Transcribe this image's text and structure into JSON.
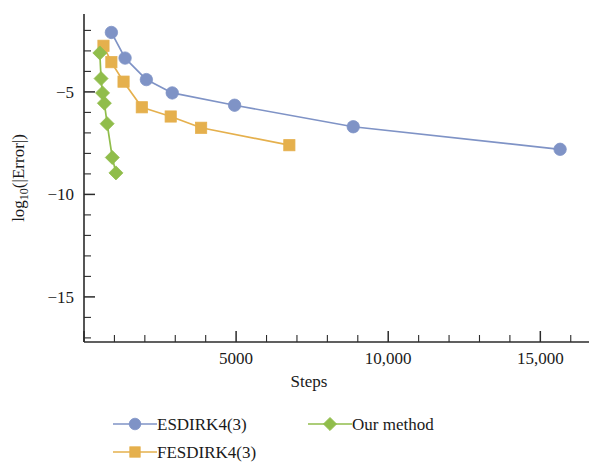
{
  "chart_data": {
    "type": "line",
    "title": "",
    "xlabel": "Steps",
    "ylabel": "log10(|Error|)",
    "ylabel_display": "log₁₀(|Error|)",
    "xlim": [
      0,
      16600
    ],
    "ylim": [
      -17.2,
      -1.2
    ],
    "grid": false,
    "legend_position": "bottom",
    "x_ticks_major": [
      5000,
      10000,
      15000
    ],
    "x_tick_labels": [
      "5000",
      "10,000",
      "15,000"
    ],
    "x_ticks_minor": [
      1000,
      2000,
      3000,
      4000,
      6000,
      7000,
      8000,
      9000,
      11000,
      12000,
      13000,
      14000,
      16000
    ],
    "y_ticks_major": [
      -5,
      -10,
      -15
    ],
    "y_tick_labels": [
      "−5",
      "−10",
      "−15"
    ],
    "y_ticks_minor": [
      -2,
      -3,
      -4,
      -6,
      -7,
      -8,
      -9,
      -11,
      -12,
      -13,
      -14,
      -16,
      -17
    ],
    "series": [
      {
        "name": "ESDIRK4(3)",
        "color": "#7f93c6",
        "marker": "circle",
        "x": [
          900,
          1350,
          2050,
          2900,
          4950,
          8850,
          15650
        ],
        "y": [
          -2.1,
          -3.35,
          -4.4,
          -5.05,
          -5.65,
          -6.7,
          -7.8
        ]
      },
      {
        "name": "FESDIRK4(3)",
        "color": "#e5b04d",
        "marker": "square",
        "x": [
          640,
          900,
          1300,
          1900,
          2850,
          3850,
          6750
        ],
        "y": [
          -2.75,
          -3.55,
          -4.5,
          -5.75,
          -6.2,
          -6.75,
          -7.6
        ]
      },
      {
        "name": "Our method",
        "color": "#90bd4b",
        "marker": "diamond",
        "x": [
          520,
          560,
          610,
          670,
          760,
          930,
          1050
        ],
        "y": [
          -3.1,
          -4.35,
          -5.05,
          -5.55,
          -6.55,
          -8.2,
          -8.95
        ]
      }
    ]
  },
  "legend": {
    "items": [
      {
        "label": "ESDIRK4(3)",
        "color": "#7f93c6",
        "marker": "circle"
      },
      {
        "label": "FESDIRK4(3)",
        "color": "#e5b04d",
        "marker": "square"
      },
      {
        "label": "Our method",
        "color": "#90bd4b",
        "marker": "diamond"
      }
    ]
  }
}
